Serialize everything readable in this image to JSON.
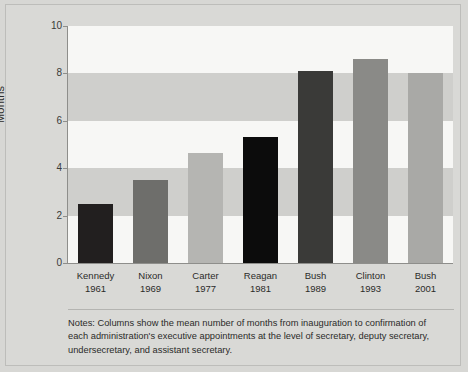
{
  "chart_data": {
    "type": "bar",
    "title": "",
    "xlabel": "",
    "ylabel": "Months",
    "ylim": [
      0,
      10
    ],
    "yticks": [
      0,
      2,
      4,
      6,
      8,
      10
    ],
    "grid": "alternating horizontal bands",
    "legend": "none",
    "categories": [
      "Kennedy 1961",
      "Nixon 1969",
      "Carter 1977",
      "Reagan 1981",
      "Bush 1989",
      "Clinton 1993",
      "Bush 2001"
    ],
    "values": [
      2.5,
      3.5,
      4.65,
      5.3,
      8.1,
      8.6,
      8.0
    ],
    "bar_colors": [
      "#221f1f",
      "#6e6e6b",
      "#b5b5b2",
      "#0c0c0c",
      "#3a3a38",
      "#8a8a87",
      "#a9a9a6"
    ]
  },
  "axis": {
    "y_title": "Months",
    "y_ticks": [
      "10",
      "8",
      "6",
      "4",
      "2",
      "0"
    ]
  },
  "x_categories": [
    {
      "name": "Kennedy",
      "year": "1961"
    },
    {
      "name": "Nixon",
      "year": "1969"
    },
    {
      "name": "Carter",
      "year": "1977"
    },
    {
      "name": "Reagan",
      "year": "1981"
    },
    {
      "name": "Bush",
      "year": "1989"
    },
    {
      "name": "Clinton",
      "year": "1993"
    },
    {
      "name": "Bush",
      "year": "2001"
    }
  ],
  "notes": {
    "line1": "Notes: Columns show the mean number of months from inauguration to confirmation of",
    "line2": "each administration's executive appointments at the level of secretary, deputy secretary,",
    "line3": "undersecretary, and assistant secretary."
  },
  "colors": {
    "page_background": "#d9d9d6",
    "plot_background": "#d6d6d3",
    "band_light": "#f7f7f5",
    "band_dark": "#cfcfcc",
    "axis_line": "#8e8e8b",
    "text": "#2b2b29"
  }
}
